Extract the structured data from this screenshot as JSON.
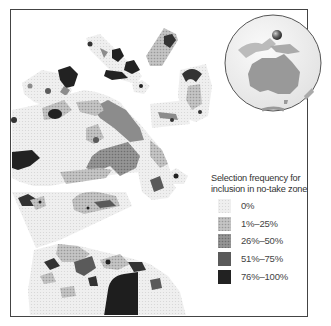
{
  "figure": {
    "type": "map",
    "inset": {
      "description": "Globe centered on Australia with a marker sphere north of Australia indicating study region",
      "marker_color": "#555555"
    }
  },
  "legend": {
    "title_line1": "Selection frequency for",
    "title_line2": "inclusion in no-take zone",
    "items": [
      {
        "label": "0%",
        "color": "#ebebeb"
      },
      {
        "label": "1%–25%",
        "color": "#b8b8b8"
      },
      {
        "label": "26%–50%",
        "color": "#8c8c8c"
      },
      {
        "label": "51%–75%",
        "color": "#5a5a5a"
      },
      {
        "label": "76%–100%",
        "color": "#222222"
      }
    ]
  }
}
